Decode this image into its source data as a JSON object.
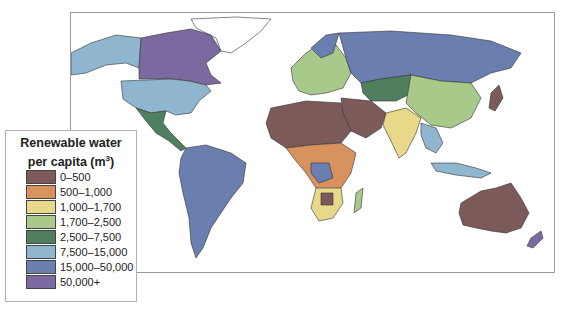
{
  "legend": {
    "title_line1": "Renewable water",
    "title_line2": "per capita (m",
    "title_sup": "3",
    "title_end": ")",
    "items": [
      {
        "label": "0–500",
        "color": "#7d5a5a"
      },
      {
        "label": "500–1,000",
        "color": "#d8925e"
      },
      {
        "label": "1,000–1,700",
        "color": "#e8d98a"
      },
      {
        "label": "1,700–2,500",
        "color": "#a9c98a"
      },
      {
        "label": "2,500–7,500",
        "color": "#4f7f5e"
      },
      {
        "label": "7,500–15,000",
        "color": "#8fb5cf"
      },
      {
        "label": "15,000–50,000",
        "color": "#6a7fb0"
      },
      {
        "label": "50,000+",
        "color": "#7a6aa0"
      }
    ]
  },
  "map": {
    "title": "World map of renewable water per capita",
    "regions": [
      {
        "name": "Greenland",
        "class": "none"
      },
      {
        "name": "Canada",
        "class": "50,000+"
      },
      {
        "name": "United States",
        "class": "7,500–15,000"
      },
      {
        "name": "Mexico",
        "class": "2,500–7,500"
      },
      {
        "name": "South America",
        "class": "15,000–50,000"
      },
      {
        "name": "North Africa / Sahara",
        "class": "0–500"
      },
      {
        "name": "Sub-Saharan Africa",
        "class": "mixed"
      },
      {
        "name": "Southern Africa",
        "class": "1,000–1,700"
      },
      {
        "name": "Europe",
        "class": "mixed"
      },
      {
        "name": "Russia",
        "class": "15,000–50,000"
      },
      {
        "name": "Middle East",
        "class": "0–500"
      },
      {
        "name": "Central Asia",
        "class": "2,500–7,500"
      },
      {
        "name": "China",
        "class": "1,700–2,500"
      },
      {
        "name": "India",
        "class": "1,000–1,700"
      },
      {
        "name": "Southeast Asia",
        "class": "7,500–15,000"
      },
      {
        "name": "Australia",
        "class": "15,000–50,000"
      },
      {
        "name": "New Zealand",
        "class": "50,000+"
      }
    ]
  }
}
